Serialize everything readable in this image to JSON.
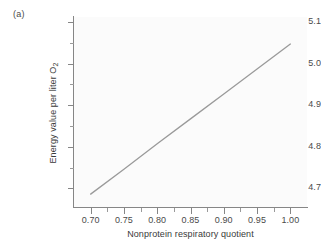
{
  "panel": {
    "label": "(a)"
  },
  "chart_data": {
    "type": "line",
    "title": "",
    "xlabel": "Nonprotein respiratory quotient",
    "ylabel_text": "Energy value per liter O",
    "ylabel_subscript": "2",
    "xlim": [
      0.675,
      1.025
    ],
    "ylim": [
      4.655,
      5.112
    ],
    "grid": false,
    "legend": null,
    "x_ticks_major": [
      0.7,
      0.75,
      0.8,
      0.85,
      0.9,
      0.95,
      1.0
    ],
    "x_tick_labels": [
      "0.70",
      "0.75",
      "0.80",
      "0.85",
      "0.90",
      "0.95",
      "1.00"
    ],
    "x_ticks_minor": [
      0.725,
      0.775,
      0.825,
      0.875,
      0.925,
      0.975
    ],
    "y_ticks_major": [
      4.7,
      4.8,
      4.9,
      5.0,
      5.1
    ],
    "y_tick_labels": [
      "4.7",
      "4.8",
      "4.9",
      "5.0",
      "5.1"
    ],
    "y_ticks_minor": [
      4.75,
      4.85,
      4.95,
      5.05
    ],
    "series": [
      {
        "name": "energy value",
        "color": "#9a9a9a",
        "x": [
          0.7,
          0.75,
          0.8,
          0.85,
          0.9,
          0.95,
          1.0
        ],
        "values": [
          4.686,
          4.746,
          4.807,
          4.867,
          4.927,
          4.987,
          5.047
        ]
      }
    ]
  }
}
